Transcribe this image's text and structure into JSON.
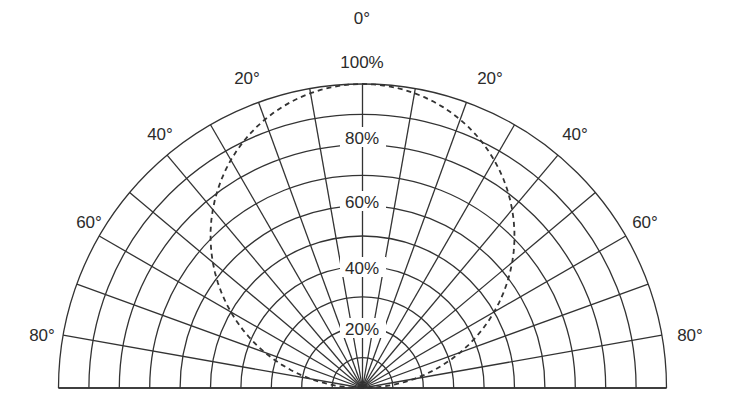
{
  "chart_data": {
    "type": "polar",
    "title": "",
    "angle_range_deg": [
      -90,
      90
    ],
    "angle_grid_step_deg": 10,
    "radial_range_pct": [
      0,
      100
    ],
    "radial_grid_step_pct": 10,
    "grid": true,
    "angle_labels": [
      {
        "angle": -80,
        "text": "80°"
      },
      {
        "angle": -60,
        "text": "60°"
      },
      {
        "angle": -40,
        "text": "40°"
      },
      {
        "angle": -20,
        "text": "20°"
      },
      {
        "angle": 0,
        "text": "0°"
      },
      {
        "angle": 20,
        "text": "20°"
      },
      {
        "angle": 40,
        "text": "40°"
      },
      {
        "angle": 60,
        "text": "60°"
      },
      {
        "angle": 80,
        "text": "80°"
      }
    ],
    "radial_labels": [
      {
        "value": 20,
        "text": "20%"
      },
      {
        "value": 40,
        "text": "40%"
      },
      {
        "value": 60,
        "text": "60%"
      },
      {
        "value": 80,
        "text": "80%"
      },
      {
        "value": 100,
        "text": "100%"
      }
    ],
    "series": [
      {
        "name": "cosine distribution",
        "style": "dashed",
        "angles_deg": [
          -90,
          -80,
          -70,
          -60,
          -50,
          -40,
          -30,
          -20,
          -10,
          0,
          10,
          20,
          30,
          40,
          50,
          60,
          70,
          80,
          90
        ],
        "values_pct": [
          0,
          17,
          34,
          50,
          64,
          77,
          87,
          94,
          98,
          100,
          98,
          94,
          87,
          77,
          64,
          50,
          34,
          17,
          0
        ]
      }
    ]
  },
  "labels": {
    "a0": "0°",
    "r100": "100%",
    "r80": "80%",
    "r60": "60%",
    "r40": "40%",
    "r20": "20%",
    "l20": "20°",
    "l40": "40°",
    "l60": "60°",
    "l80": "80°",
    "rt20": "20°",
    "rt40": "40°",
    "rt60": "60°",
    "rt80": "80°"
  }
}
